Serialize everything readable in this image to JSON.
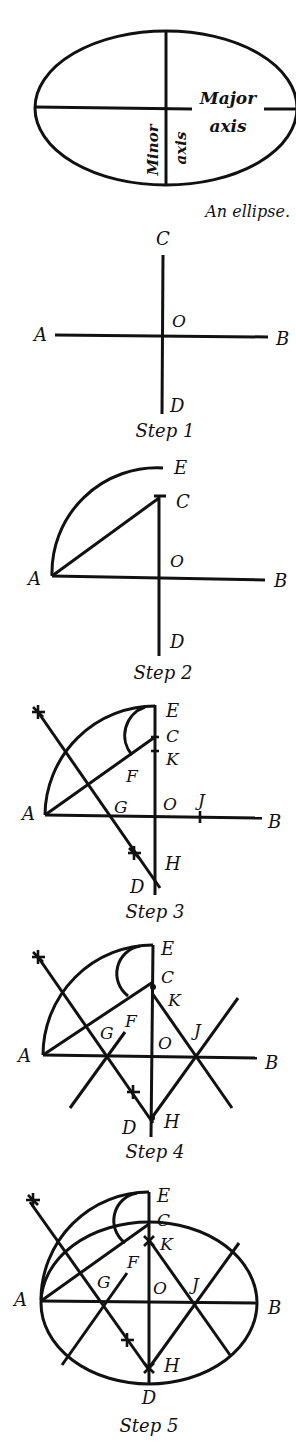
{
  "figure": {
    "overview": {
      "major_axis_label_line1": "Major",
      "major_axis_label_line2": "axis",
      "minor_axis_label_line1": "Minor",
      "minor_axis_label_line2": "axis",
      "caption": "An ellipse."
    },
    "step1": {
      "caption": "Step 1",
      "points": {
        "A": "A",
        "B": "B",
        "C": "C",
        "D": "D",
        "O": "O"
      }
    },
    "step2": {
      "caption": "Step 2",
      "points": {
        "A": "A",
        "B": "B",
        "C": "C",
        "D": "D",
        "E": "E",
        "O": "O"
      }
    },
    "step3": {
      "caption": "Step 3",
      "points": {
        "A": "A",
        "B": "B",
        "C": "C",
        "D": "D",
        "E": "E",
        "F": "F",
        "G": "G",
        "H": "H",
        "J": "J",
        "K": "K",
        "O": "O"
      }
    },
    "step4": {
      "caption": "Step 4",
      "points": {
        "A": "A",
        "B": "B",
        "C": "C",
        "D": "D",
        "E": "E",
        "F": "F",
        "G": "G",
        "H": "H",
        "J": "J",
        "K": "K",
        "O": "O"
      }
    },
    "step5": {
      "caption": "Step 5",
      "points": {
        "A": "A",
        "B": "B",
        "C": "C",
        "D": "D",
        "E": "E",
        "F": "F",
        "G": "G",
        "H": "H",
        "J": "J",
        "K": "K",
        "O": "O"
      }
    }
  }
}
